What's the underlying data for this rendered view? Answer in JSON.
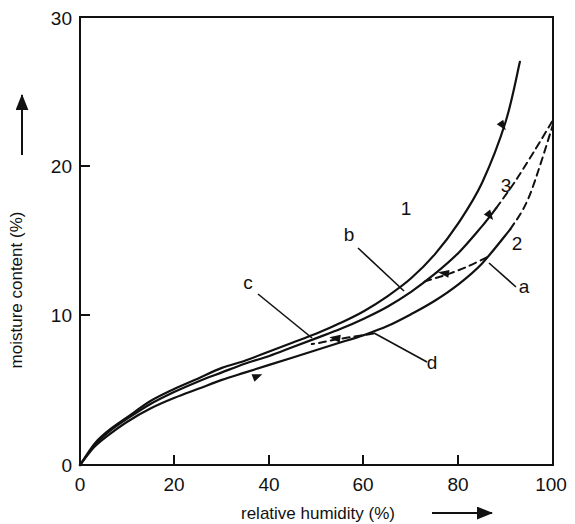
{
  "chart_data": {
    "type": "line",
    "title": "",
    "xlabel": "relative humidity (%)",
    "ylabel": "moisture content (%)",
    "xlim": [
      0,
      100
    ],
    "ylim": [
      0,
      30
    ],
    "xticks": [
      "0",
      "20",
      "40",
      "60",
      "80",
      "100"
    ],
    "yticks": [
      "0",
      "10",
      "20",
      "30"
    ],
    "xtick_values": [
      0,
      20,
      40,
      60,
      80,
      100
    ],
    "ytick_values": [
      0,
      10,
      20,
      30
    ],
    "grid": false,
    "legend": "none",
    "axis_arrows": {
      "x": "right",
      "y": "up"
    },
    "series": [
      {
        "name": "1",
        "label": "1",
        "style": "solid",
        "arrow_direction": "up-right",
        "x": [
          0,
          3,
          6,
          10,
          15,
          20,
          25,
          30,
          35,
          40,
          45,
          50,
          55,
          60,
          65,
          70,
          75,
          80,
          85,
          90,
          93
        ],
        "y": [
          0,
          1.4,
          2.3,
          3.2,
          4.3,
          5.1,
          5.8,
          6.5,
          7.0,
          7.6,
          8.2,
          8.8,
          9.5,
          10.3,
          11.3,
          12.5,
          14.1,
          16.2,
          18.9,
          23.0,
          27.0
        ]
      },
      {
        "name": "3",
        "label": "3",
        "style": "solid-with-dashed-tail",
        "arrow_direction": "down-right",
        "dash_begins_at_x": 88,
        "x": [
          0,
          3,
          6,
          10,
          15,
          20,
          25,
          30,
          35,
          40,
          45,
          50,
          55,
          60,
          65,
          70,
          75,
          80,
          85,
          88,
          92,
          96,
          100
        ],
        "y": [
          0,
          1.3,
          2.2,
          3.1,
          4.1,
          4.9,
          5.6,
          6.2,
          6.8,
          7.3,
          7.9,
          8.5,
          9.1,
          9.8,
          10.6,
          11.6,
          12.8,
          14.2,
          16.0,
          17.2,
          19.0,
          21.0,
          23.1
        ]
      },
      {
        "name": "2",
        "label": "2",
        "style": "solid-with-dashed-tail",
        "arrow_direction": "none",
        "dash_begins_at_x": 91,
        "x": [
          0,
          3,
          6,
          10,
          15,
          20,
          25,
          30,
          35,
          40,
          45,
          50,
          55,
          60,
          65,
          70,
          75,
          80,
          85,
          91,
          95,
          100
        ],
        "y": [
          0,
          1.2,
          2.0,
          2.9,
          3.8,
          4.5,
          5.1,
          5.7,
          6.2,
          6.7,
          7.2,
          7.7,
          8.2,
          8.7,
          9.3,
          10.1,
          11.0,
          12.1,
          13.5,
          15.8,
          18.0,
          22.8
        ]
      },
      {
        "name": "a",
        "label": "a",
        "style": "dashed",
        "kind": "scanning-curve",
        "arrow_direction": "left",
        "x": [
          86,
          82,
          78,
          74,
          72
        ],
        "y": [
          13.9,
          13.3,
          12.8,
          12.4,
          12.2
        ]
      },
      {
        "name": "cd",
        "label_left": "c",
        "label_right": "d",
        "style": "dashed",
        "kind": "scanning-curve",
        "arrow_direction": "left",
        "x": [
          62,
          58,
          54,
          51,
          49
        ],
        "y": [
          8.8,
          8.6,
          8.4,
          8.2,
          8.1
        ]
      }
    ],
    "curve_labels": [
      {
        "text": "1",
        "x_px": 406,
        "y_px": 215
      },
      {
        "text": "3",
        "x_px": 506,
        "y_px": 192
      },
      {
        "text": "2",
        "x_px": 517,
        "y_px": 250
      },
      {
        "text": "b",
        "x_px": 349,
        "y_px": 241
      },
      {
        "text": "a",
        "x_px": 524,
        "y_px": 293
      },
      {
        "text": "c",
        "x_px": 248,
        "y_px": 289
      },
      {
        "text": "d",
        "x_px": 432,
        "y_px": 369
      }
    ],
    "annotations": [
      {
        "name": "b",
        "points_to": "upper-dashed-scanning-curve-left-end"
      },
      {
        "name": "a",
        "points_to": "upper-dashed-scanning-curve-right-end"
      },
      {
        "name": "c",
        "points_to": "lower-dashed-scanning-curve-right-end"
      },
      {
        "name": "d",
        "points_to": "lower-dashed-scanning-curve-right-end"
      }
    ],
    "direction_markers": [
      {
        "on_curve": "1",
        "at_x": 90,
        "direction": "up-right"
      },
      {
        "on_curve": "3",
        "at_x": 83,
        "direction": "up-right"
      },
      {
        "on_curve": "2",
        "at_x": 37,
        "direction": "right"
      },
      {
        "on_curve": "a",
        "direction": "left"
      },
      {
        "on_curve": "cd",
        "direction": "left"
      }
    ]
  }
}
